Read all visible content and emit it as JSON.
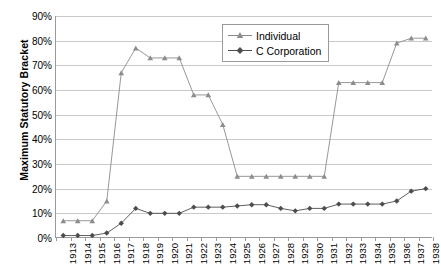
{
  "chart_data": {
    "type": "line",
    "title": "",
    "xlabel": "",
    "ylabel": "Maximum Statutory Bracket",
    "ylim": [
      0,
      0.9
    ],
    "ytick_labels": [
      "0%",
      "10%",
      "20%",
      "30%",
      "40%",
      "50%",
      "60%",
      "70%",
      "80%",
      "90%"
    ],
    "grid": true,
    "legend_position": "top-right",
    "categories": [
      "1913",
      "1914",
      "1915",
      "1916",
      "1917",
      "1918",
      "1919",
      "1920",
      "1921",
      "1922",
      "1923",
      "1924",
      "1925",
      "1926",
      "1927",
      "1928",
      "1929",
      "1930",
      "1931",
      "1932",
      "1933",
      "1934",
      "1935",
      "1936",
      "1937",
      "1938"
    ],
    "series": [
      {
        "name": "Individual",
        "marker": "triangle",
        "color": "#8c8c8c",
        "values": [
          7,
          7,
          7,
          15,
          67,
          77,
          73,
          73,
          73,
          58,
          58,
          46,
          25,
          25,
          25,
          25,
          25,
          25,
          25,
          63,
          63,
          63,
          63,
          79,
          81,
          81
        ]
      },
      {
        "name": "C Corporation",
        "marker": "diamond",
        "color": "#4d4d4d",
        "values": [
          1,
          1,
          1,
          2,
          6,
          12,
          10,
          10,
          10,
          12.5,
          12.5,
          12.5,
          13,
          13.5,
          13.5,
          12,
          11,
          12,
          12,
          13.75,
          13.75,
          13.75,
          13.75,
          15,
          19,
          20
        ]
      }
    ]
  },
  "legend": {
    "items": [
      {
        "label": "Individual"
      },
      {
        "label": "C Corporation"
      }
    ]
  },
  "axis": {
    "y_title": "Maximum Statutory Bracket"
  }
}
